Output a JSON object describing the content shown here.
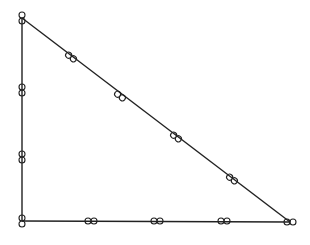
{
  "diagram": {
    "type": "right-triangle",
    "background": "#ffffff",
    "stroke": "#222222",
    "vertices": [
      {
        "name": "top",
        "x": 22,
        "y": 18
      },
      {
        "name": "bottom-left",
        "x": 22,
        "y": 221
      },
      {
        "name": "bottom-right",
        "x": 290,
        "y": 222
      }
    ],
    "edges": [
      {
        "name": "left-edge",
        "from": 0,
        "to": 1
      },
      {
        "name": "bottom-edge",
        "from": 1,
        "to": 2
      },
      {
        "name": "hypotenuse",
        "from": 0,
        "to": 2
      }
    ],
    "markers": {
      "glyph": "infinity-loop",
      "vertex_markers": [
        {
          "x": 22,
          "y": 18,
          "orientation": "vertical"
        },
        {
          "x": 22,
          "y": 221,
          "orientation": "vertical"
        },
        {
          "x": 290,
          "y": 222,
          "orientation": "horizontal"
        }
      ],
      "left_edge": [
        {
          "x": 22,
          "y": 90,
          "orientation": "vertical"
        },
        {
          "x": 22,
          "y": 157,
          "orientation": "vertical"
        }
      ],
      "bottom_edge": [
        {
          "x": 91,
          "y": 221,
          "orientation": "horizontal"
        },
        {
          "x": 157,
          "y": 221,
          "orientation": "horizontal"
        },
        {
          "x": 224,
          "y": 221,
          "orientation": "horizontal"
        }
      ],
      "hypotenuse": [
        {
          "x": 71,
          "y": 57,
          "orientation": "diagonal"
        },
        {
          "x": 120,
          "y": 96,
          "orientation": "diagonal"
        },
        {
          "x": 176,
          "y": 137,
          "orientation": "diagonal"
        },
        {
          "x": 232,
          "y": 179,
          "orientation": "diagonal"
        }
      ]
    }
  }
}
